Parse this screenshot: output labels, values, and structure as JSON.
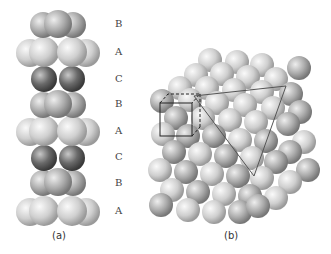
{
  "figure": {
    "panel_a": {
      "caption": "(a)",
      "layers": [
        {
          "label": "B",
          "y": 24,
          "tone": "mid"
        },
        {
          "label": "A",
          "y": 52,
          "tone": "light"
        },
        {
          "label": "C",
          "y": 79,
          "tone": "dark"
        },
        {
          "label": "B",
          "y": 104,
          "tone": "mid"
        },
        {
          "label": "A",
          "y": 131,
          "tone": "light"
        },
        {
          "label": "C",
          "y": 157,
          "tone": "dark"
        },
        {
          "label": "B",
          "y": 183,
          "tone": "mid"
        },
        {
          "label": "A",
          "y": 211,
          "tone": "light"
        }
      ]
    },
    "panel_b": {
      "caption": "(b)",
      "unit_cell": "cube outline (solid front, dashed back)",
      "close_packed_plane": "triangle outline"
    },
    "colors": {
      "light": "#d8d8d8",
      "mid": "#b4b4b4",
      "dark": "#6e6e6e",
      "line": "#555555",
      "cube": "#222222"
    }
  }
}
